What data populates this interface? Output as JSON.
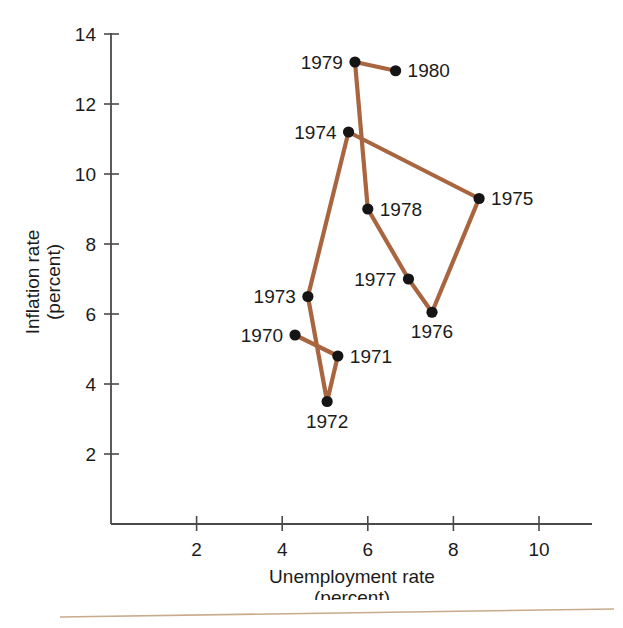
{
  "figure": {
    "title_fragment": "Inflation and Unemployment (cut off)",
    "accent_line_color": "#a9653f",
    "axis_color": "#4a4a4a",
    "point_color": "#151515",
    "rule_color": "#c8ab8c",
    "background": "#ffffff"
  },
  "chart_data": {
    "type": "line",
    "title": "",
    "xlabel": "Unemployment rate",
    "xlabel_sub": "(percent)",
    "ylabel": "Inflation rate",
    "ylabel_sub": "(percent)",
    "xlim": [
      0,
      11.2
    ],
    "ylim": [
      0,
      14.6
    ],
    "xticks": [
      2,
      4,
      6,
      8,
      10
    ],
    "yticks": [
      2,
      4,
      6,
      8,
      10,
      12,
      14
    ],
    "grid": false,
    "legend": null,
    "connected": true,
    "series": [
      {
        "name": "Phillips curve path 1970-1980",
        "points": [
          {
            "label": "1970",
            "x": 4.3,
            "y": 5.4,
            "label_side": "left"
          },
          {
            "label": "1971",
            "x": 5.3,
            "y": 4.8,
            "label_side": "right"
          },
          {
            "label": "1972",
            "x": 5.05,
            "y": 3.5,
            "label_side": "below"
          },
          {
            "label": "1973",
            "x": 4.6,
            "y": 6.5,
            "label_side": "left"
          },
          {
            "label": "1974",
            "x": 5.55,
            "y": 11.2,
            "label_side": "left"
          },
          {
            "label": "1975",
            "x": 8.6,
            "y": 9.3,
            "label_side": "right"
          },
          {
            "label": "1976",
            "x": 7.5,
            "y": 6.05,
            "label_side": "below"
          },
          {
            "label": "1977",
            "x": 6.95,
            "y": 7.0,
            "label_side": "left"
          },
          {
            "label": "1978",
            "x": 6.0,
            "y": 9.0,
            "label_side": "right"
          },
          {
            "label": "1979",
            "x": 5.7,
            "y": 13.2,
            "label_side": "left"
          },
          {
            "label": "1980",
            "x": 6.65,
            "y": 12.95,
            "label_side": "right"
          }
        ]
      }
    ]
  }
}
